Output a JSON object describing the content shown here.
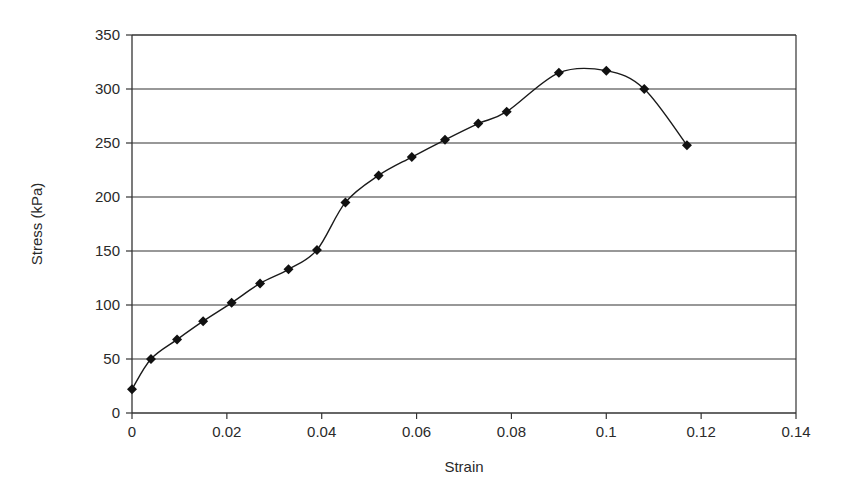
{
  "chart_data": {
    "type": "line",
    "title": "",
    "xlabel": "Strain",
    "ylabel": "Stress (kPa)",
    "xlim": [
      0,
      0.14
    ],
    "ylim": [
      0,
      350
    ],
    "x_ticks": [
      0,
      0.02,
      0.04,
      0.06,
      0.08,
      0.1,
      0.12,
      0.14
    ],
    "x_tick_labels": [
      "0",
      "0.02",
      "0.04",
      "0.06",
      "0.08",
      "0.1",
      "0.12",
      "0.14"
    ],
    "y_ticks": [
      0,
      50,
      100,
      150,
      200,
      250,
      300,
      350
    ],
    "y_tick_labels": [
      "0",
      "50",
      "100",
      "150",
      "200",
      "250",
      "300",
      "350"
    ],
    "grid": {
      "horizontal": true,
      "vertical": false
    },
    "legend": null,
    "marker": "diamond",
    "smoothed": true,
    "series": [
      {
        "name": "Stress",
        "color": "#1a1a1a",
        "x": [
          0,
          0.004,
          0.0095,
          0.015,
          0.021,
          0.027,
          0.033,
          0.039,
          0.045,
          0.052,
          0.059,
          0.066,
          0.073,
          0.079,
          0.09,
          0.1,
          0.108,
          0.117
        ],
        "y": [
          22,
          50,
          68,
          85,
          102,
          120,
          133,
          151,
          195,
          220,
          237,
          253,
          268,
          279,
          315,
          317,
          300,
          248
        ]
      }
    ]
  },
  "colors": {
    "background": "#ffffff",
    "axis": "#333333",
    "grid": "#333333",
    "line": "#1a1a1a",
    "marker": "#111111"
  }
}
